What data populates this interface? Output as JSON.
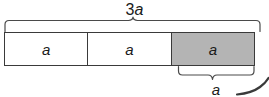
{
  "figure": {
    "type": "bar-partition-diagram",
    "total_label": "3a",
    "total_label_coefficient": "3",
    "total_label_variable": "a",
    "segment_label": "a",
    "cells": [
      {
        "label": "a",
        "shaded": false
      },
      {
        "label": "a",
        "shaded": false
      },
      {
        "label": "a",
        "shaded": true
      }
    ],
    "braces": {
      "top": {
        "label": "3a",
        "spans_cells": 3,
        "direction": "up"
      },
      "bottom": {
        "label": "a",
        "spans_cells": 1,
        "direction": "down"
      }
    },
    "colors": {
      "shade_fill": "#b4b4b4",
      "unshaded_fill": "#ffffff",
      "outline": "#3a3a3a",
      "brace_stroke": "#4a4a4a",
      "text": "#1a1a1a",
      "background": "#ffffff"
    }
  }
}
